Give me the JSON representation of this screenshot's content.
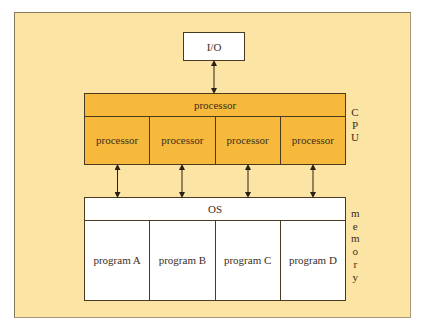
{
  "diagram": {
    "io": {
      "label": "I/O"
    },
    "cpu": {
      "side_label": [
        "C",
        "P",
        "U"
      ],
      "header": "processor",
      "cells": [
        "processor",
        "processor",
        "processor",
        "processor"
      ]
    },
    "memory": {
      "side_label": [
        "m",
        "e",
        "m",
        "o",
        "r",
        "y"
      ],
      "header": "OS",
      "cells": [
        "program A",
        "program B",
        "program C",
        "program D"
      ]
    },
    "colors": {
      "panel": "#fce4a4",
      "cpu_fill": "#f6b93c",
      "box_fill": "#ffffff",
      "stroke": "#4a3a22"
    },
    "connections": [
      {
        "from": "io",
        "to": "cpu",
        "type": "bidirectional"
      },
      {
        "from": "cpu.cells.0",
        "to": "memory",
        "type": "bidirectional"
      },
      {
        "from": "cpu.cells.1",
        "to": "memory",
        "type": "bidirectional"
      },
      {
        "from": "cpu.cells.2",
        "to": "memory",
        "type": "bidirectional"
      },
      {
        "from": "cpu.cells.3",
        "to": "memory",
        "type": "bidirectional"
      }
    ]
  }
}
